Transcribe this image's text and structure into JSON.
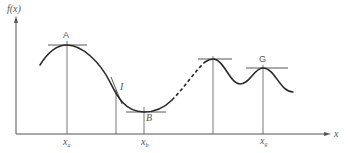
{
  "diagram": {
    "y_axis_label": "f(x)",
    "x_axis_label": "x",
    "points": [
      {
        "id": "A",
        "label": "A",
        "kind": "local maximum (global max)",
        "x_label": "x",
        "x_sub": "a"
      },
      {
        "id": "I",
        "label": "I",
        "kind": "inflection point"
      },
      {
        "id": "B",
        "label": "B",
        "kind": "local minimum",
        "x_label": "x",
        "x_sub": "b"
      },
      {
        "id": "P3",
        "label": "",
        "kind": "local maximum"
      },
      {
        "id": "G",
        "label": "G",
        "kind": "local maximum",
        "x_label": "x",
        "x_sub": "g"
      }
    ],
    "curve_segments": [
      {
        "style": "solid",
        "from": "left start",
        "to": "after B"
      },
      {
        "style": "dashed",
        "from": "after B",
        "to": "near third peak"
      },
      {
        "style": "solid",
        "from": "third peak",
        "to": "right end"
      }
    ],
    "colors": {
      "curve": "#2a2a2a",
      "axes": "#555555",
      "background": "#ffffff"
    }
  }
}
